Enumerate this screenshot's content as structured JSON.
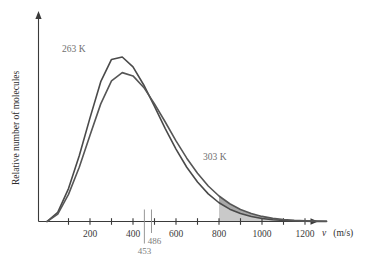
{
  "chart_data": {
    "type": "line",
    "title": "",
    "xlabel": "v (m/s)",
    "xlabel_symbol": "v",
    "xlabel_units": "(m/s)",
    "ylabel": "Relative number of molecules",
    "xlim": [
      0,
      1300
    ],
    "ylim": [
      0,
      1.12
    ],
    "grid": false,
    "legend_position": "inline-annotations",
    "x_ticks": [
      0,
      100,
      200,
      300,
      400,
      500,
      600,
      700,
      800,
      900,
      1000,
      1100,
      1200
    ],
    "x_tick_labels": [
      "",
      "",
      "200",
      "",
      "400",
      "",
      "600",
      "",
      "800",
      "",
      "1000",
      "",
      "1200"
    ],
    "y_ticks": [],
    "y_tick_labels": [],
    "series": [
      {
        "name": "263 K",
        "label": "263 K",
        "temperature_K": 263,
        "color": "#4a4a4a",
        "peak_speed": 300,
        "peak_value": 1.0,
        "x": [
          0,
          50,
          100,
          150,
          200,
          250,
          300,
          350,
          400,
          450,
          500,
          550,
          600,
          650,
          700,
          750,
          800,
          850,
          900,
          950,
          1000,
          1050,
          1100,
          1150,
          1200,
          1250,
          1300
        ],
        "values": [
          0.0,
          0.055,
          0.2,
          0.4,
          0.63,
          0.85,
          0.985,
          1.0,
          0.94,
          0.83,
          0.7,
          0.565,
          0.44,
          0.33,
          0.24,
          0.168,
          0.114,
          0.075,
          0.048,
          0.03,
          0.018,
          0.011,
          0.006,
          0.0035,
          0.002,
          0.001,
          0.0005
        ]
      },
      {
        "name": "303 K",
        "label": "303 K",
        "temperature_K": 303,
        "color": "#565656",
        "peak_speed": 345,
        "peak_value": 0.905,
        "x": [
          0,
          50,
          100,
          150,
          200,
          250,
          300,
          350,
          400,
          450,
          500,
          550,
          600,
          650,
          700,
          750,
          800,
          850,
          900,
          950,
          1000,
          1050,
          1100,
          1150,
          1200,
          1250,
          1300
        ],
        "values": [
          0.0,
          0.045,
          0.165,
          0.33,
          0.525,
          0.715,
          0.855,
          0.905,
          0.885,
          0.815,
          0.715,
          0.605,
          0.49,
          0.385,
          0.293,
          0.216,
          0.155,
          0.108,
          0.073,
          0.048,
          0.031,
          0.019,
          0.012,
          0.007,
          0.004,
          0.0022,
          0.0012
        ]
      }
    ],
    "markers": [
      {
        "name": "453",
        "label": "453",
        "value": 453,
        "color": "#8c8c8c"
      },
      {
        "name": "486",
        "label": "486",
        "value": 486,
        "color": "#8c8c8c"
      }
    ],
    "shaded_region": {
      "name": "tail-above-800",
      "from": 800,
      "to": 1300,
      "fill_color": "#c9c9c9",
      "fill_color_upper": "#a8a8a8"
    },
    "annotations": [
      {
        "name": "263 K",
        "text": "263 K",
        "x": 175,
        "y": 0.8
      },
      {
        "name": "303 K",
        "text": "303 K",
        "x": 790,
        "y": 0.345
      }
    ]
  }
}
